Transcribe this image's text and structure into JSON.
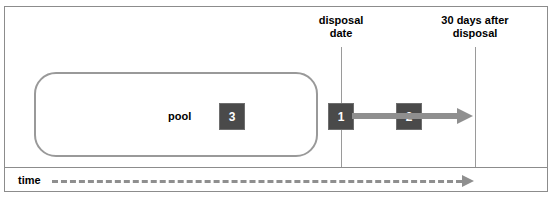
{
  "diagram": {
    "title": "",
    "colors": {
      "frame_border": "#8c8c8c",
      "pool_border": "#999999",
      "box_fill": "#4a4a4a",
      "box_text": "#ffffff",
      "arrow": "#8f8f8f",
      "marker_line": "#9a9a9a",
      "background": "#ffffff"
    },
    "markers": [
      {
        "id": "disposal-date",
        "label": "disposal\ndate"
      },
      {
        "id": "thirty-days-after-disposal",
        "label": "30 days after\ndisposal"
      }
    ],
    "pool": {
      "label": "pool",
      "box": {
        "id": "box-3",
        "number": "3"
      }
    },
    "stages": [
      {
        "id": "box-1",
        "number": "1"
      },
      {
        "id": "box-2",
        "number": "2"
      }
    ],
    "timeline": {
      "label": "time",
      "direction": "left-to-right",
      "style": "dashed-arrow"
    }
  }
}
